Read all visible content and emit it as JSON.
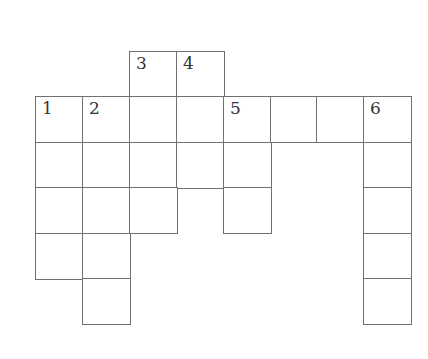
{
  "puzzle": {
    "type": "crossword-grid",
    "origin": {
      "x": 35,
      "y": 51
    },
    "cell_size": {
      "w": 46.9,
      "h": 45.4
    },
    "colors": {
      "line": "#707070",
      "number": "#333333",
      "background": "#ffffff"
    },
    "cells": [
      {
        "row": 0,
        "col": 2,
        "number": "3"
      },
      {
        "row": 0,
        "col": 3,
        "number": "4"
      },
      {
        "row": 1,
        "col": 0,
        "number": "1"
      },
      {
        "row": 1,
        "col": 1,
        "number": "2"
      },
      {
        "row": 1,
        "col": 2,
        "number": ""
      },
      {
        "row": 1,
        "col": 3,
        "number": ""
      },
      {
        "row": 1,
        "col": 4,
        "number": "5"
      },
      {
        "row": 1,
        "col": 5,
        "number": ""
      },
      {
        "row": 1,
        "col": 6,
        "number": ""
      },
      {
        "row": 1,
        "col": 7,
        "number": "6"
      },
      {
        "row": 2,
        "col": 0,
        "number": ""
      },
      {
        "row": 2,
        "col": 1,
        "number": ""
      },
      {
        "row": 2,
        "col": 2,
        "number": ""
      },
      {
        "row": 2,
        "col": 3,
        "number": ""
      },
      {
        "row": 2,
        "col": 4,
        "number": ""
      },
      {
        "row": 2,
        "col": 7,
        "number": ""
      },
      {
        "row": 3,
        "col": 0,
        "number": ""
      },
      {
        "row": 3,
        "col": 1,
        "number": ""
      },
      {
        "row": 3,
        "col": 2,
        "number": ""
      },
      {
        "row": 3,
        "col": 4,
        "number": ""
      },
      {
        "row": 3,
        "col": 7,
        "number": ""
      },
      {
        "row": 4,
        "col": 0,
        "number": ""
      },
      {
        "row": 4,
        "col": 1,
        "number": ""
      },
      {
        "row": 4,
        "col": 7,
        "number": ""
      },
      {
        "row": 5,
        "col": 1,
        "number": ""
      },
      {
        "row": 5,
        "col": 7,
        "number": ""
      }
    ],
    "clue_numbers": [
      "1",
      "2",
      "3",
      "4",
      "5",
      "6"
    ]
  }
}
